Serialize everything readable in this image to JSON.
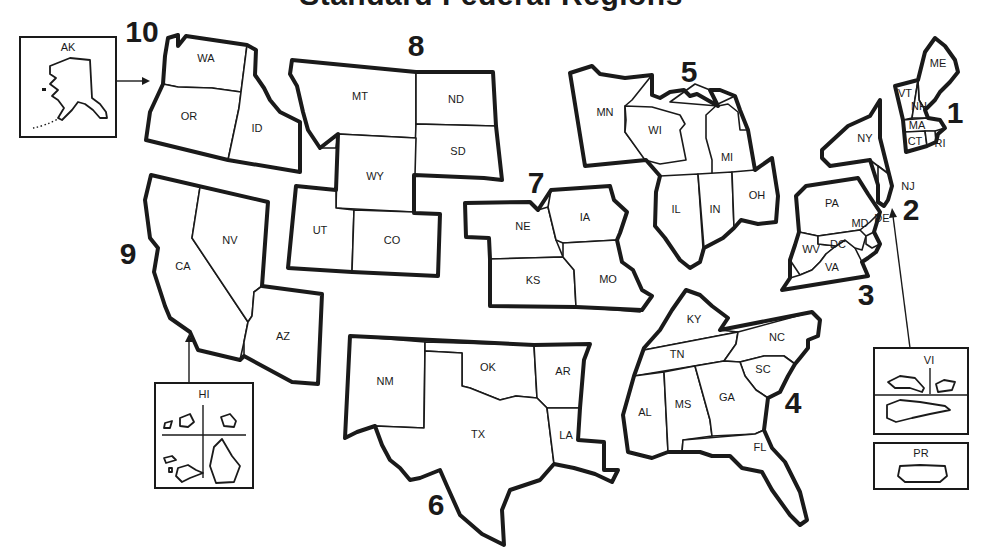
{
  "title": "Standard Federal Regions",
  "regions": [
    {
      "number": "1",
      "states": [
        "ME",
        "VT",
        "NH",
        "MA",
        "CT",
        "RI"
      ]
    },
    {
      "number": "2",
      "states": [
        "NY",
        "NJ",
        "PR",
        "VI"
      ]
    },
    {
      "number": "3",
      "states": [
        "PA",
        "DE",
        "MD",
        "DC",
        "WV",
        "VA"
      ]
    },
    {
      "number": "4",
      "states": [
        "KY",
        "TN",
        "NC",
        "SC",
        "AL",
        "MS",
        "GA",
        "FL"
      ]
    },
    {
      "number": "5",
      "states": [
        "MN",
        "WI",
        "MI",
        "IL",
        "IN",
        "OH"
      ]
    },
    {
      "number": "6",
      "states": [
        "NM",
        "OK",
        "AR",
        "TX",
        "LA"
      ]
    },
    {
      "number": "7",
      "states": [
        "NE",
        "IA",
        "KS",
        "MO"
      ]
    },
    {
      "number": "8",
      "states": [
        "MT",
        "ND",
        "SD",
        "WY",
        "UT",
        "CO"
      ]
    },
    {
      "number": "9",
      "states": [
        "CA",
        "NV",
        "AZ",
        "HI"
      ]
    },
    {
      "number": "10",
      "states": [
        "WA",
        "OR",
        "ID",
        "AK"
      ]
    }
  ],
  "labels": {
    "r1": "1",
    "r2": "2",
    "r3": "3",
    "r4": "4",
    "r5": "5",
    "r6": "6",
    "r7": "7",
    "r8": "8",
    "r9": "9",
    "r10": "10",
    "ME": "ME",
    "VT": "VT",
    "NH": "NH",
    "MA": "MA",
    "CT": "CT",
    "RI": "RI",
    "NY": "NY",
    "NJ": "NJ",
    "PA": "PA",
    "DE": "DE",
    "MD": "MD",
    "DC": "DC",
    "WV": "WV",
    "VA": "VA",
    "KY": "KY",
    "TN": "TN",
    "NC": "NC",
    "SC": "SC",
    "AL": "AL",
    "MS": "MS",
    "GA": "GA",
    "FL": "FL",
    "MN": "MN",
    "WI": "WI",
    "MI": "MI",
    "IL": "IL",
    "IN": "IN",
    "OH": "OH",
    "NM": "NM",
    "OK": "OK",
    "AR": "AR",
    "TX": "TX",
    "LA": "LA",
    "NE": "NE",
    "IA": "IA",
    "KS": "KS",
    "MO": "MO",
    "MT": "MT",
    "ND": "ND",
    "SD": "SD",
    "WY": "WY",
    "UT": "UT",
    "CO": "CO",
    "CA": "CA",
    "NV": "NV",
    "AZ": "AZ",
    "WA": "WA",
    "OR": "OR",
    "ID": "ID"
  },
  "insets": {
    "alaska": {
      "label": "AK",
      "arrow_to_region": "10"
    },
    "hawaii": {
      "label": "HI",
      "arrow_to_region": "9"
    },
    "virgin_islands": {
      "label": "VI",
      "arrow_to_region": "2"
    },
    "puerto_rico": {
      "label": "PR"
    }
  }
}
